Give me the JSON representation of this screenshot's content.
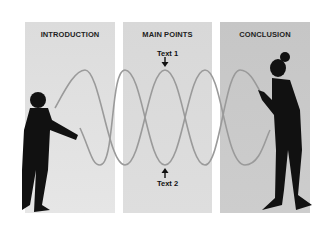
{
  "panels": [
    {
      "title": "INTRODUCTION",
      "color": "#e0e0e0"
    },
    {
      "title": "MAIN POINTS",
      "color": "#dadada"
    },
    {
      "title": "CONCLUSION",
      "color": "#c9c9c9"
    }
  ],
  "labels": {
    "top": "Text 1",
    "bottom": "Text 2"
  },
  "rope_color": "#9a9a9a",
  "figure_color": "#111111"
}
